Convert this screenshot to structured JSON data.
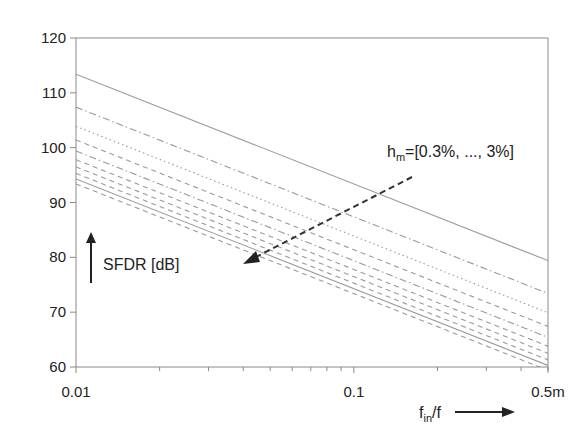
{
  "chart_data": {
    "type": "line",
    "title": "",
    "xlabel": "f_in/f",
    "xlabel_main": "f",
    "xlabel_sub": "in",
    "xlabel_tail": "/f",
    "ylabel": "SFDR [dB]",
    "xscale": "log",
    "xlim": [
      0.01,
      0.5
    ],
    "ylim": [
      60,
      120
    ],
    "xticks": [
      0.01,
      0.1,
      0.5
    ],
    "xtick_labels": [
      "0.01",
      "0.1",
      "0.5m"
    ],
    "yticks": [
      60,
      70,
      80,
      90,
      100,
      110,
      120
    ],
    "ytick_labels": [
      "60",
      "70",
      "80",
      "90",
      "100",
      "110",
      "120"
    ],
    "grid": false,
    "legend": "none",
    "annotation": {
      "prefix": "h",
      "sub": "m",
      "text": "=[0.3%, ..., 3%]",
      "full": "h_m=[0.3%, ..., 3%]",
      "arrow": "dashed arrow pointing from top-right to bottom-left indicating increasing h_m lowers SFDR"
    },
    "x": [
      0.01,
      0.5
    ],
    "series": [
      {
        "name": "h_m=0.3%",
        "style": "solid",
        "values": [
          113.4,
          79.4
        ]
      },
      {
        "name": "h_m=0.6%",
        "style": "dashdot",
        "values": [
          107.4,
          73.4
        ]
      },
      {
        "name": "h_m=0.9%",
        "style": "dotted",
        "values": [
          103.9,
          69.9
        ]
      },
      {
        "name": "h_m=1.2%",
        "style": "dashed",
        "values": [
          101.4,
          67.4
        ]
      },
      {
        "name": "h_m=1.5%",
        "style": "dashdot",
        "values": [
          99.4,
          65.4
        ]
      },
      {
        "name": "h_m=1.8%",
        "style": "dashed",
        "values": [
          97.8,
          63.8
        ]
      },
      {
        "name": "h_m=2.1%",
        "style": "dashed",
        "values": [
          96.5,
          62.5
        ]
      },
      {
        "name": "h_m=2.4%",
        "style": "dashed",
        "values": [
          95.3,
          61.3
        ]
      },
      {
        "name": "h_m=2.7%",
        "style": "solid",
        "values": [
          94.3,
          60.3
        ]
      },
      {
        "name": "h_m=3.0%",
        "style": "dashed",
        "values": [
          93.4,
          59.4
        ]
      }
    ]
  },
  "colors": {
    "axis": "#8a8a8a",
    "line": "#9a9a9a",
    "text": "#222222",
    "arrow": "#333333"
  }
}
